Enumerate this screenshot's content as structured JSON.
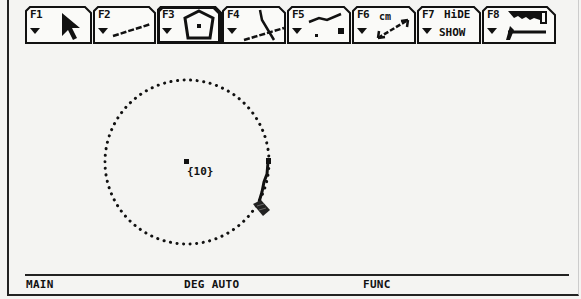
{
  "toolbar": {
    "tabs": [
      {
        "key": "F1",
        "icon": "pointer-arrow-icon",
        "selected": false
      },
      {
        "key": "F2",
        "icon": "line-icon",
        "selected": false
      },
      {
        "key": "F3",
        "icon": "curves-polygons-icon",
        "selected": true
      },
      {
        "key": "F4",
        "icon": "construction-icon",
        "selected": false
      },
      {
        "key": "F5",
        "icon": "transformation-icon",
        "selected": false
      },
      {
        "key": "F6",
        "icon": "measurement-icon",
        "unit_label": "cm",
        "selected": false
      },
      {
        "key": "F7",
        "icon": "display-icon",
        "line1": "HiDE",
        "line2": "SHOW",
        "selected": false
      },
      {
        "key": "F8",
        "icon": "draw-tools-icon",
        "selected": false
      }
    ]
  },
  "canvas": {
    "circle": {
      "center": [
        187,
        162
      ],
      "radius": 82,
      "style": "dotted"
    },
    "center_label": "{10}",
    "cursor": "pencil-icon"
  },
  "status_bar": {
    "folder": "MAIN",
    "mode": "DEG AUTO",
    "graph_mode": "FUNC"
  }
}
